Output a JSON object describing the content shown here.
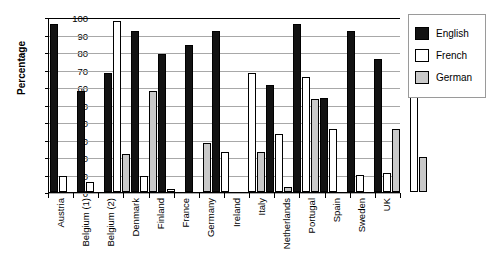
{
  "chart_data": {
    "type": "bar",
    "title": "",
    "xlabel": "",
    "ylabel": "Percentage",
    "ylim": [
      0,
      100
    ],
    "ytick_step": 10,
    "yticks": [
      100,
      90,
      80,
      70,
      60,
      50,
      40,
      30,
      20,
      10,
      0
    ],
    "grid": true,
    "legend_position": "right",
    "categories": [
      "Austria",
      "Belgium (1)",
      "Belgium (2)",
      "Denmark",
      "Finland",
      "France",
      "Germany",
      "Ireland",
      "Italy",
      "Netherlands",
      "Portugal",
      "Spain",
      "Sweden",
      "UK"
    ],
    "series": [
      {
        "name": "English",
        "color": "#121212",
        "values": [
          96,
          58,
          68,
          92,
          79,
          84,
          92,
          null,
          61,
          96,
          54,
          92,
          76,
          null
        ]
      },
      {
        "name": "French",
        "color": "#ffffff",
        "values": [
          9,
          6,
          98,
          9,
          2,
          null,
          23,
          68,
          33,
          66,
          36,
          10,
          11,
          60
        ]
      },
      {
        "name": "German",
        "color": "#c9c9c9",
        "values": [
          null,
          null,
          22,
          58,
          null,
          28,
          null,
          23,
          3,
          53,
          null,
          null,
          36,
          20
        ]
      }
    ]
  },
  "legend": {
    "items": [
      {
        "label": "English",
        "swatch": "english"
      },
      {
        "label": "French",
        "swatch": "french"
      },
      {
        "label": "German",
        "swatch": "german"
      }
    ]
  }
}
